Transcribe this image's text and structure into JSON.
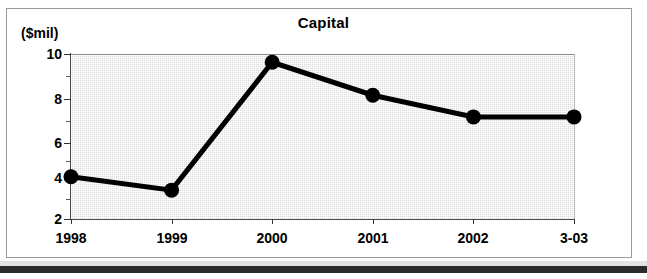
{
  "chart_data": {
    "type": "line",
    "title": "Capital",
    "ylabel": "($mil)",
    "xlabel": "",
    "categories": [
      "1998",
      "1999",
      "2000",
      "2001",
      "2002",
      "3-03"
    ],
    "values": [
      4.05,
      3.4,
      9.6,
      8.0,
      6.95,
      6.95
    ],
    "series": [
      {
        "name": "Capital",
        "values": [
          4.05,
          3.4,
          9.6,
          8.0,
          6.95,
          6.95
        ]
      }
    ],
    "ylim": [
      2,
      10
    ],
    "y_ticks": [
      2,
      4,
      6,
      8,
      10
    ],
    "y_tick_labels": [
      "2",
      "4",
      "6",
      "8",
      "10"
    ],
    "y_minor_ticks": [
      3,
      5,
      7,
      9
    ],
    "grid": false,
    "legend": "none",
    "plot_background": "#dcdcdc",
    "line_color": "#000000",
    "marker_color": "#000000",
    "marker_shape": "circle"
  },
  "axis": {
    "y_unit_label": "($mil)",
    "y_tick_labels": [
      "10",
      "8",
      "6",
      "4",
      "2"
    ],
    "x_tick_labels": [
      "1998",
      "1999",
      "2000",
      "2001",
      "2002",
      "3-03"
    ]
  },
  "header": {
    "title": "Capital"
  }
}
